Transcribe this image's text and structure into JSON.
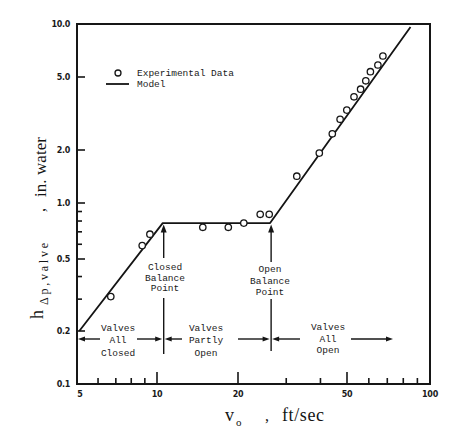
{
  "chart_data": {
    "type": "scatter",
    "title": "",
    "xlabel": "v_o , ft/sec",
    "ylabel": "h_Δp,valve , in. water",
    "xlabel_parts": {
      "main": "v",
      "sub": "o",
      "sep": ",",
      "unit": "ft/sec"
    },
    "ylabel_parts": {
      "main": "h",
      "sub": "Δp,valve",
      "sep": ",",
      "unit": "in. water"
    },
    "xscale": "log",
    "yscale": "log",
    "xlim": [
      5,
      100
    ],
    "ylim": [
      0.1,
      10.0
    ],
    "xticks": [
      5,
      10,
      20,
      50,
      100
    ],
    "xtick_labels": [
      "5",
      "10",
      "20",
      "50",
      "100"
    ],
    "x_minor_ticks": [
      6,
      7,
      8,
      9,
      30,
      40,
      60,
      70,
      80,
      90
    ],
    "yticks": [
      0.1,
      0.2,
      0.5,
      1.0,
      2.0,
      5.0,
      10.0
    ],
    "ytick_labels": [
      "0.1",
      "0.2",
      "0.5",
      "1.0",
      "2.0",
      "5.0",
      "10.0"
    ],
    "y_minor_ticks": [
      0.3,
      0.4,
      0.6,
      0.7,
      0.8,
      0.9
    ],
    "grid": false,
    "legend": {
      "position": "upper left",
      "entries": [
        {
          "label": "Experimental Data",
          "marker": "open-circle"
        },
        {
          "label": "Model",
          "marker": "line"
        }
      ]
    },
    "series": [
      {
        "name": "Experimental Data",
        "type": "scatter",
        "marker": "open-circle",
        "x": [
          6.7,
          8.8,
          9.4,
          14.8,
          18.4,
          21.0,
          24.1,
          26.0,
          32.8,
          39.6,
          44.2,
          47.2,
          49.9,
          53.0,
          56.0,
          58.5,
          60.8,
          64.7,
          67.5
        ],
        "y": [
          0.31,
          0.59,
          0.68,
          0.74,
          0.74,
          0.78,
          0.87,
          0.87,
          1.42,
          1.92,
          2.45,
          2.94,
          3.3,
          3.9,
          4.29,
          4.77,
          5.36,
          5.85,
          6.58
        ]
      },
      {
        "name": "Model",
        "type": "line",
        "x": [
          5.1,
          10.5,
          26.2,
          85.0
        ],
        "y": [
          0.2,
          0.78,
          0.78,
          9.6
        ]
      }
    ],
    "annotations": [
      {
        "id": "closed-balance-point",
        "lines": [
          "Closed",
          "Balance",
          "Point"
        ],
        "x": 10.5,
        "arrow": "up"
      },
      {
        "id": "open-balance-point",
        "lines": [
          "Open",
          "Balance",
          "Point"
        ],
        "x": 26.2,
        "arrow": "up"
      }
    ],
    "regions": [
      {
        "id": "valves-all-closed",
        "lines": [
          "Valves",
          "All",
          "Closed"
        ],
        "x_from": 5,
        "x_to": 10.5
      },
      {
        "id": "valves-partly-open",
        "lines": [
          "Valves",
          "Partly",
          "Open"
        ],
        "x_from": 10.5,
        "x_to": 26.2
      },
      {
        "id": "valves-all-open",
        "lines": [
          "Valves",
          "All",
          "Open"
        ],
        "x_from": 26.2,
        "x_to": 100
      }
    ]
  }
}
